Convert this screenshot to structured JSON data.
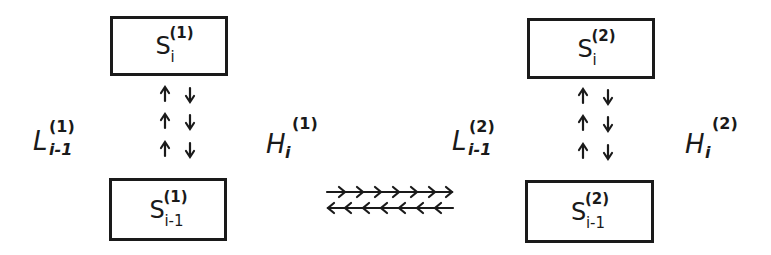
{
  "diagram": {
    "stage1": {
      "upper_state": {
        "base": "S",
        "sub": "i",
        "sup": "(1)"
      },
      "lower_state": {
        "base": "S",
        "sub": "i-1",
        "sup": "(1)"
      },
      "left_label": {
        "base": "L",
        "sub": "i-1",
        "sup": "(1)"
      },
      "right_label": {
        "base": "H",
        "sub": "i",
        "sup": "(1)"
      },
      "vertical_arrows": {
        "up_count": 3,
        "down_count": 3
      }
    },
    "stage2": {
      "upper_state": {
        "base": "S",
        "sub": "i",
        "sup": "(2)"
      },
      "lower_state": {
        "base": "S",
        "sub": "i-1",
        "sup": "(2)"
      },
      "left_label": {
        "base": "L",
        "sub": "i-1",
        "sup": "(2)"
      },
      "right_label": {
        "base": "H",
        "sub": "i",
        "sup": "(2)"
      },
      "vertical_arrows": {
        "up_count": 3,
        "down_count": 3
      }
    },
    "horizontal_exchange": {
      "forward_chevrons": 7,
      "backward_chevrons": 7,
      "direction_top": "right",
      "direction_bottom": "left"
    }
  }
}
